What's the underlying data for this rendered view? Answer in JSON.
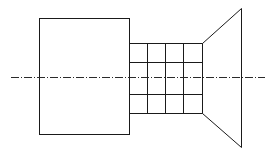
{
  "diagram": {
    "width": 268,
    "height": 154,
    "stroke_color": "#1a1a1a",
    "centerline_color": "#2a2a2a",
    "shapes": {
      "left_block": {
        "x": 39,
        "y": 18,
        "w": 90,
        "h": 116
      },
      "grid": {
        "x": 129,
        "y": 43,
        "w": 73,
        "h": 70,
        "columns_x": [
          129,
          147,
          165,
          183,
          202
        ],
        "rows_y": [
          43,
          62,
          94,
          113
        ]
      },
      "trapezoid": {
        "points": [
          [
            202,
            43
          ],
          [
            241,
            8
          ],
          [
            241,
            147
          ],
          [
            202,
            113
          ]
        ]
      },
      "centerline": {
        "x1": 11,
        "x2": 265,
        "y": 77,
        "pattern": "8,2,1,2"
      }
    }
  }
}
